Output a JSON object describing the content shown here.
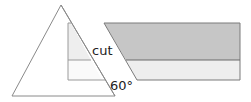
{
  "diagram": {
    "labels": {
      "cut": "cut",
      "angle": "60°"
    },
    "colors": {
      "outline": "#8a8a8a",
      "dark_fill": "#c6c6c6",
      "light_fill": "#eeeeee",
      "triangle_fill": "#ffffff",
      "inner_top_fill": "#eeeeee",
      "inner_bottom_fill": "#fafafa"
    }
  }
}
